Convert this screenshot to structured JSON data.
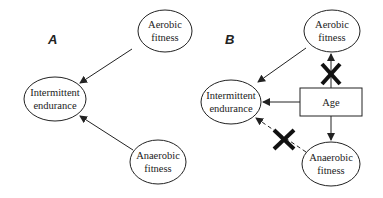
{
  "panels": {
    "A": {
      "label": "A",
      "nodes": {
        "aerobic": {
          "line1": "Aerobic",
          "line2": "fitness"
        },
        "intermittent": {
          "line1": "Intermittent",
          "line2": "endurance"
        },
        "anaerobic": {
          "line1": "Anaerobic",
          "line2": "fitness"
        }
      },
      "edges": [
        {
          "from": "Aerobic fitness",
          "to": "Intermittent endurance",
          "style": "solid"
        },
        {
          "from": "Anaerobic fitness",
          "to": "Intermittent endurance",
          "style": "solid"
        }
      ]
    },
    "B": {
      "label": "B",
      "nodes": {
        "aerobic": {
          "line1": "Aerobic",
          "line2": "fitness"
        },
        "intermittent": {
          "line1": "Intermittent",
          "line2": "endurance"
        },
        "age": {
          "label": "Age"
        },
        "anaerobic": {
          "line1": "Anaerobic",
          "line2": "fitness"
        }
      },
      "edges": [
        {
          "from": "Aerobic fitness",
          "to": "Intermittent endurance",
          "style": "solid"
        },
        {
          "from": "Age",
          "to": "Aerobic fitness",
          "style": "solid",
          "crossed": true
        },
        {
          "from": "Age",
          "to": "Intermittent endurance",
          "style": "solid"
        },
        {
          "from": "Age",
          "to": "Anaerobic fitness",
          "style": "solid"
        },
        {
          "from": "Anaerobic fitness",
          "to": "Intermittent endurance",
          "style": "dashed",
          "crossed": true
        }
      ]
    }
  },
  "colors": {
    "stroke": "#222222",
    "background": "#ffffff"
  }
}
